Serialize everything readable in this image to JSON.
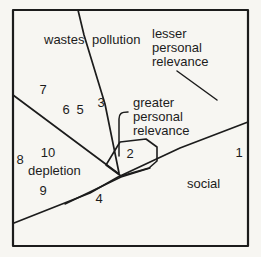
{
  "figure": {
    "type": "mds-concept-map",
    "colors": {
      "background": "#f7f6f2",
      "line": "#1c1c1c"
    },
    "regions": {
      "wastes": {
        "label": "wastes"
      },
      "pollution": {
        "label": "pollution"
      },
      "depletion": {
        "label": "depletion"
      },
      "social": {
        "label": "social"
      }
    },
    "annotations": {
      "lesser": {
        "lines": [
          "lesser",
          "personal",
          "relevance"
        ]
      },
      "greater": {
        "lines": [
          "greater",
          "personal",
          "relevance"
        ]
      }
    },
    "points": [
      {
        "label": "1"
      },
      {
        "label": "2"
      },
      {
        "label": "3"
      },
      {
        "label": "4"
      },
      {
        "label": "5"
      },
      {
        "label": "6"
      },
      {
        "label": "7"
      },
      {
        "label": "8"
      },
      {
        "label": "9"
      },
      {
        "label": "10"
      }
    ]
  }
}
